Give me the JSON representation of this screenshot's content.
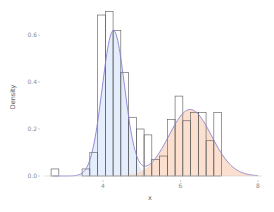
{
  "chart_data": {
    "type": "histogram",
    "title": "",
    "xlabel": "x",
    "ylabel": "Density",
    "xlim": [
      2.3,
      8.1
    ],
    "ylim": [
      0,
      0.72
    ],
    "x_ticks": [
      4,
      6,
      8
    ],
    "x_tick_labels": [
      "4",
      "6",
      "8"
    ],
    "y_ticks": [
      0.0,
      0.2,
      0.4,
      0.6
    ],
    "y_tick_labels": [
      "0.0",
      "0.2",
      "0.4",
      "0.6"
    ],
    "grid": false,
    "legend": null,
    "histogram": {
      "bin_width": 0.2,
      "bins": [
        {
          "x0": 2.66,
          "density": 0.03
        },
        {
          "x0": 3.46,
          "density": 0.03
        },
        {
          "x0": 3.66,
          "density": 0.1
        },
        {
          "x0": 3.86,
          "density": 0.685
        },
        {
          "x0": 4.06,
          "density": 0.7
        },
        {
          "x0": 4.26,
          "density": 0.62
        },
        {
          "x0": 4.46,
          "density": 0.44
        },
        {
          "x0": 4.66,
          "density": 0.25
        },
        {
          "x0": 4.86,
          "density": 0.2
        },
        {
          "x0": 5.06,
          "density": 0.175
        },
        {
          "x0": 5.26,
          "density": 0.07
        },
        {
          "x0": 5.46,
          "density": 0.085
        },
        {
          "x0": 5.66,
          "density": 0.24
        },
        {
          "x0": 5.86,
          "density": 0.34
        },
        {
          "x0": 6.06,
          "density": 0.235
        },
        {
          "x0": 6.26,
          "density": 0.27
        },
        {
          "x0": 6.46,
          "density": 0.27
        },
        {
          "x0": 6.66,
          "density": 0.15
        },
        {
          "x0": 6.86,
          "density": 0.27
        }
      ],
      "stroke": "#555555"
    },
    "series": [
      {
        "name": "component-1",
        "type": "normal-density",
        "mean": 4.27,
        "sd": 0.29,
        "weight": 0.45,
        "fill": "#dce8fb",
        "stroke": "#8a80d0"
      },
      {
        "name": "component-2",
        "type": "normal-density",
        "mean": 6.25,
        "sd": 0.55,
        "weight": 0.39,
        "fill": "#f9d6bf",
        "stroke": "#8a80d0"
      }
    ]
  }
}
